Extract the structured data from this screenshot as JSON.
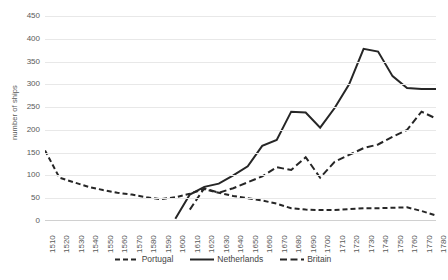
{
  "chart_data": {
    "type": "line",
    "title": "",
    "xlabel": "",
    "ylabel": "number of ships",
    "ylim": [
      0,
      450
    ],
    "yticks": [
      0,
      50,
      100,
      150,
      200,
      250,
      300,
      350,
      400,
      450
    ],
    "grid": true,
    "legend_position": "bottom",
    "categories": [
      "1510",
      "1520",
      "1530",
      "1540",
      "1550",
      "1560",
      "1570",
      "1580",
      "1590",
      "1600",
      "1610",
      "1620",
      "1630",
      "1640",
      "1650",
      "1660",
      "1670",
      "1680",
      "1690",
      "1700",
      "1710",
      "1720",
      "1730",
      "1740",
      "1750",
      "1760",
      "1770",
      "1780"
    ],
    "series": [
      {
        "name": "Portugal",
        "style": "dashed",
        "color": "#262626",
        "values": [
          155,
          95,
          85,
          75,
          68,
          62,
          58,
          52,
          48,
          52,
          60,
          70,
          62,
          55,
          50,
          45,
          38,
          28,
          25,
          24,
          24,
          26,
          28,
          28,
          29,
          30,
          22,
          12
        ]
      },
      {
        "name": "Netherlands",
        "style": "solid",
        "color": "#262626",
        "values": [
          null,
          null,
          null,
          null,
          null,
          null,
          null,
          null,
          null,
          5,
          58,
          75,
          82,
          100,
          120,
          165,
          178,
          240,
          238,
          205,
          248,
          300,
          378,
          372,
          318,
          292,
          290,
          290
        ]
      },
      {
        "name": "Britain",
        "style": "long-dashed",
        "color": "#262626",
        "values": [
          null,
          null,
          null,
          null,
          null,
          null,
          null,
          null,
          null,
          null,
          25,
          72,
          62,
          72,
          85,
          98,
          118,
          112,
          140,
          95,
          130,
          145,
          160,
          168,
          185,
          200,
          240,
          225
        ]
      }
    ]
  },
  "legend": {
    "items": [
      {
        "label": "Portugal",
        "style": "dashed"
      },
      {
        "label": "Netherlands",
        "style": "solid"
      },
      {
        "label": "Britain",
        "style": "long-dashed"
      }
    ]
  }
}
